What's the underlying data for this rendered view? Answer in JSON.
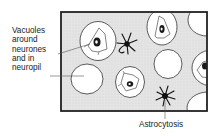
{
  "diagram": {
    "labels": {
      "vacuoles": "Vacuoles\naround\nneurones\nand in\nneuropil",
      "astrocytosis": "Astrocytosis"
    },
    "colors": {
      "frame_border": "#222222",
      "tissue_fill": "#e2e2e2",
      "vacuole_fill": "#ffffff",
      "outline": "#333333",
      "nucleus": "#1a1a1a"
    },
    "elements": [
      "neurone with surrounding vacuole (top-left)",
      "neurone with surrounding vacuole (top-middle)",
      "neurone with surrounding vacuole (bottom-middle)",
      "neurone with surrounding vacuole (right edge, partial)",
      "empty vacuole in neuropil (left)",
      "empty vacuole in neuropil (middle)",
      "empty vacuole (top-right, partial)",
      "empty vacuole (bottom-right, partial)",
      "astrocyte (upper)",
      "astrocyte (lower)"
    ]
  }
}
